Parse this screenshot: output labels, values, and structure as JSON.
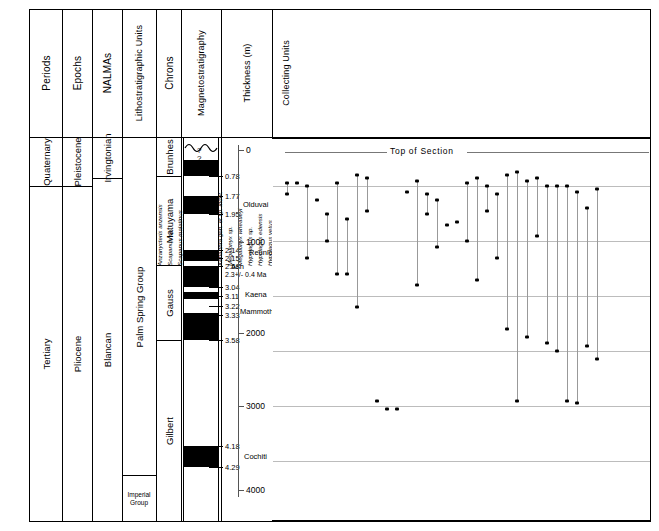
{
  "figure": {
    "top_of_section_label": "Top of Section",
    "uncertainty_marker": "?"
  },
  "columns": {
    "headers": [
      {
        "key": "periods",
        "label": "Periods"
      },
      {
        "key": "epochs",
        "label": "Epochs"
      },
      {
        "key": "nalmas",
        "label": "NALMAs"
      },
      {
        "key": "litho",
        "label": "Lithostratigraphic Units"
      },
      {
        "key": "chrons",
        "label": "Chrons"
      },
      {
        "key": "magneto",
        "label": "Magnetostratigraphy"
      },
      {
        "key": "thickness",
        "label": "Thickness (m)"
      },
      {
        "key": "units",
        "label": "Collecting Units"
      }
    ]
  },
  "periods": [
    {
      "label": "Quaternary",
      "top": 138,
      "bottom": 186
    },
    {
      "label": "Tertiary",
      "top": 186,
      "bottom": 521
    }
  ],
  "epochs": [
    {
      "label": "Pleistocene",
      "top": 138,
      "bottom": 186
    },
    {
      "label": "Pliocene",
      "top": 186,
      "bottom": 521
    }
  ],
  "nalmas": [
    {
      "label": "Irvingtonian",
      "top": 138,
      "bottom": 178
    },
    {
      "label": "Blancan",
      "top": 178,
      "bottom": 521
    }
  ],
  "lithostratigraphic_units": [
    {
      "label": "Palm  Spring  Group",
      "top": 138,
      "bottom": 475
    },
    {
      "label": "Imperial Group",
      "top": 475,
      "bottom": 521
    }
  ],
  "chrons": [
    {
      "label": "Brunhes",
      "top": 138,
      "bottom": 176
    },
    {
      "label": "Matuyama",
      "top": 176,
      "bottom": 265
    },
    {
      "label": "Gauss",
      "top": 265,
      "bottom": 340
    },
    {
      "label": "Gilbert",
      "top": 340,
      "bottom": 521
    }
  ],
  "magnetostratigraphy": {
    "normal_bands": [
      {
        "top": 160,
        "bottom": 176
      },
      {
        "top": 196,
        "bottom": 214
      },
      {
        "top": 250,
        "bottom": 261
      },
      {
        "top": 266,
        "bottom": 287
      },
      {
        "top": 292,
        "bottom": 299
      },
      {
        "top": 313,
        "bottom": 340
      },
      {
        "top": 446,
        "bottom": 467
      }
    ],
    "age_ticks": [
      {
        "age": "0.78",
        "y": 176
      },
      {
        "age": "1.77",
        "y": 196
      },
      {
        "age": "1.95",
        "y": 214
      },
      {
        "age": "2.14",
        "y": 250
      },
      {
        "age": "2.15",
        "y": 258
      },
      {
        "age": "2.58",
        "y": 266
      },
      {
        "age": "3.04",
        "y": 287
      },
      {
        "age": "3.11",
        "y": 296
      },
      {
        "age": "3.22",
        "y": 306
      },
      {
        "age": "3.33",
        "y": 315
      },
      {
        "age": "3.58",
        "y": 340
      },
      {
        "age": "4.18",
        "y": 446
      },
      {
        "age": "4.29",
        "y": 467
      }
    ],
    "subchrons": [
      {
        "label": "Olduvai",
        "y": 204
      },
      {
        "label": "Reunion",
        "y": 252
      },
      {
        "label": "Kaena",
        "y": 294
      },
      {
        "label": "Mammoth",
        "y": 311
      },
      {
        "label": "Cochiti",
        "y": 456
      }
    ],
    "ash": {
      "label": "Ash",
      "sub_label": "2.3+/- 0.4 Ma",
      "y": 268
    }
  },
  "thickness_axis": {
    "title": "Thickness (m)",
    "ticks": [
      {
        "label": "0",
        "y": 150
      },
      {
        "label": "1000",
        "y": 242
      },
      {
        "label": "2000",
        "y": 333
      },
      {
        "label": "3000",
        "y": 406
      },
      {
        "label": "4000",
        "y": 490
      }
    ]
  },
  "collecting_units_axis": {
    "title": "Collecting Units",
    "ticks": [
      {
        "label": "60",
        "y": 186
      },
      {
        "label": "50",
        "y": 241
      },
      {
        "label": "40",
        "y": 296
      },
      {
        "label": "30",
        "y": 351
      },
      {
        "label": "20",
        "y": 406
      },
      {
        "label": "10",
        "y": 461
      }
    ],
    "minor_ticks": [
      167,
      204,
      222,
      259,
      278,
      315,
      333,
      370,
      388,
      425,
      443,
      480
    ]
  },
  "chart_data": {
    "type": "scatter",
    "xlabel": "",
    "ylabel": "Collecting Units",
    "ylim": [
      8,
      64
    ],
    "grid": true,
    "legend": "none",
    "note": "Each taxon is a column; dots mark first/last occurrence collecting units, connected by a vertical range line.",
    "taxa": [
      {
        "name": "Anzanycteris anzensis",
        "x": 287,
        "top": 60.5,
        "bottom": 58.5
      },
      {
        "name": "Scapanus sp.",
        "x": 297,
        "top": 60.5,
        "bottom": 60.5
      },
      {
        "name": "Scapanus malatinus",
        "x": 307,
        "top": 60.0,
        "bottom": 47.0
      },
      {
        "name": "Notiosorex jacksoni",
        "x": 317,
        "top": 57.5,
        "bottom": 57.5
      },
      {
        "name": "Sorex sp.",
        "x": 327,
        "top": 55.0,
        "bottom": 50.0
      },
      {
        "name": "Paramylodon sp.",
        "x": 337,
        "top": 60.5,
        "bottom": 44.0
      },
      {
        "name": "Xenarthra gen. et sp. indet.",
        "x": 347,
        "top": 54.0,
        "bottom": 44.0
      },
      {
        "name": "Megalonyx sp.",
        "x": 357,
        "top": 62.0,
        "bottom": 38.0
      },
      {
        "name": "Megalonyx wheatleyi",
        "x": 367,
        "top": 61.5,
        "bottom": 55.5
      },
      {
        "name": "Hypolagus sp.",
        "x": 377,
        "top": 21.0,
        "bottom": 21.0
      },
      {
        "name": "Hypolagus edensis",
        "x": 387,
        "top": 19.5,
        "bottom": 19.5
      },
      {
        "name": "Hypolagus vetus",
        "x": 397,
        "top": 19.5,
        "bottom": 19.5
      },
      {
        "name": "Nekrolagus sp.",
        "x": 407,
        "top": 59.0,
        "bottom": 59.0
      },
      {
        "name": "Pewelagus dawsonae",
        "x": 417,
        "top": 61.0,
        "bottom": 42.0
      },
      {
        "name": "Sylvilagus sp.",
        "x": 427,
        "top": 58.5,
        "bottom": 55.0
      },
      {
        "name": "Sylvilagus hibbardi",
        "x": 437,
        "top": 57.5,
        "bottom": 49.0
      },
      {
        "name": "Sylvilagus floridanus",
        "x": 447,
        "top": 53.0,
        "bottom": 53.0
      },
      {
        "name": "Lepus callotis",
        "x": 457,
        "top": 53.5,
        "bottom": 53.5
      },
      {
        "name": "Castor sp.",
        "x": 467,
        "top": 60.5,
        "bottom": 50.0
      },
      {
        "name": "Erethizon sp.",
        "x": 477,
        "top": 61.5,
        "bottom": 43.0
      },
      {
        "name": "Erethizon stirtoni",
        "x": 487,
        "top": 60.0,
        "bottom": 55.5
      },
      {
        "name": "Tamias sp.",
        "x": 497,
        "top": 58.5,
        "bottom": 47.0
      },
      {
        "name": "Spermophilus sp.",
        "x": 507,
        "top": 62.0,
        "bottom": 34.0
      },
      {
        "name": "Geomys sp.",
        "x": 517,
        "top": 62.5,
        "bottom": 21.0
      },
      {
        "name": "Geomys anzensis",
        "x": 527,
        "top": 61.0,
        "bottom": 32.5
      },
      {
        "name": "Geomys garbanii",
        "x": 537,
        "top": 61.5,
        "bottom": 51.0
      },
      {
        "name": "Thomomys sp.",
        "x": 547,
        "top": 60.0,
        "bottom": 31.5
      },
      {
        "name": "Dipodomys sp.",
        "x": 557,
        "top": 60.0,
        "bottom": 30.0
      },
      {
        "name": "Dipodomys compactus",
        "x": 567,
        "top": 60.0,
        "bottom": 21.0
      },
      {
        "name": "Dipodomys hibbardi",
        "x": 577,
        "top": 59.0,
        "bottom": 20.5
      },
      {
        "name": "Dipodomys minor",
        "x": 587,
        "top": 56.0,
        "bottom": 31.0
      },
      {
        "name": "Dipodomys n. sp. A",
        "x": 597,
        "top": 59.5,
        "bottom": 28.5
      }
    ]
  }
}
